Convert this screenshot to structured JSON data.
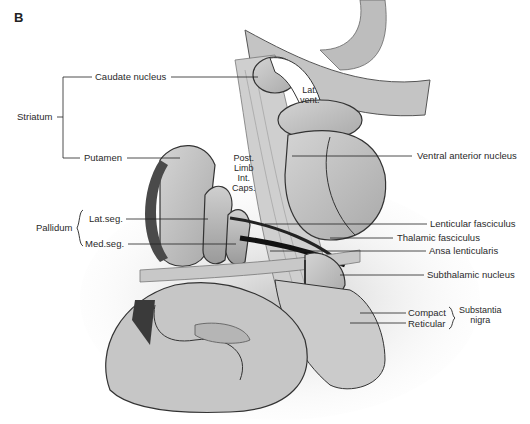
{
  "figure": {
    "panel_letter": "B",
    "groups": {
      "striatum": "Striatum",
      "pallidum": "Pallidum",
      "substantia_nigra": "Substantia nigra",
      "substantia_line1": "Substantia",
      "substantia_line2": "nigra"
    },
    "labels": {
      "caudate_nucleus": "Caudate nucleus",
      "putamen": "Putamen",
      "lat_seg": "Lat.seg.",
      "med_seg": "Med.seg.",
      "lat_vent_1": "Lat.",
      "lat_vent_2": "vent.",
      "post_limb_1": "Post.",
      "post_limb_2": "Limb",
      "post_limb_3": "Int.",
      "post_limb_4": "Caps.",
      "ventral_anterior_nucleus": "Ventral anterior nucleus",
      "lenticular_fasciculus": "Lenticular fasciculus",
      "thalamic_fasciculus": "Thalamic fasciculus",
      "ansa_lenticularis": "Ansa lenticularis",
      "subthalamic_nucleus": "Subthalamic nucleus",
      "compact": "Compact",
      "reticular": "Reticular"
    }
  }
}
